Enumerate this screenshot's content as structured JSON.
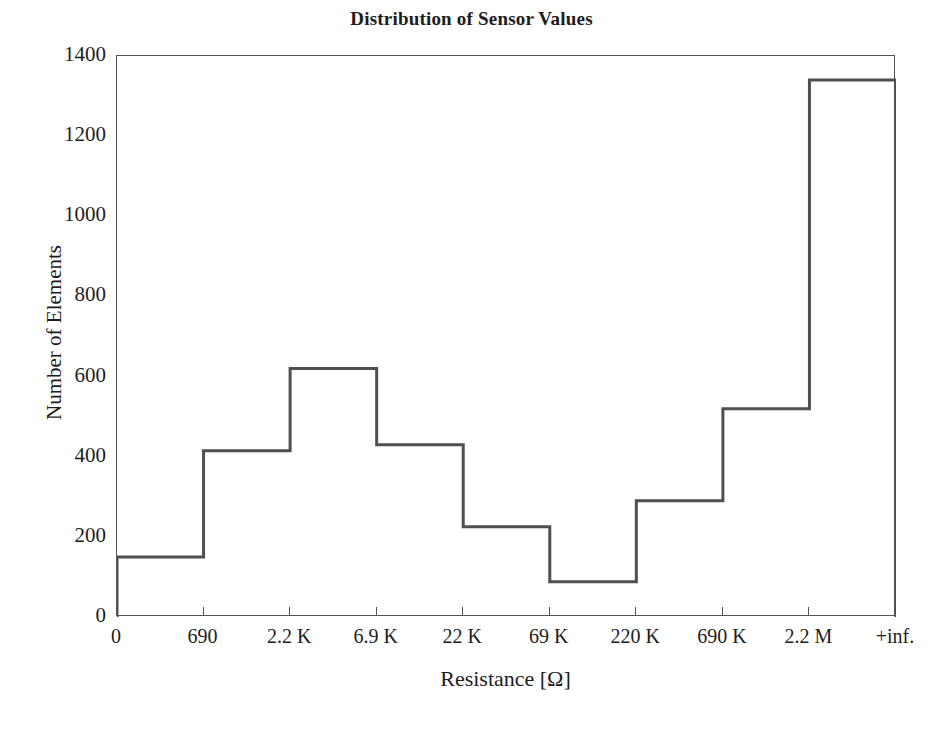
{
  "chart_data": {
    "type": "line",
    "plot_style": "step-post (histogram outline / stairs)",
    "title": "Distribution of Sensor Values",
    "xlabel": "Resistance [Ω]",
    "ylabel": "Number of Elements",
    "grid": false,
    "legend": null,
    "line_color": "#4f4f4f",
    "line_width_px": 3,
    "background_color": "#ffffff",
    "frame_color": "#555555",
    "x_tick_labels": [
      "0",
      "690",
      "2.2 K",
      "6.9 K",
      "22 K",
      "69 K",
      "220 K",
      "690 K",
      "2.2 M",
      "+inf."
    ],
    "x_bin_edges_index": [
      0,
      1,
      2,
      3,
      4,
      5,
      6,
      7,
      8,
      9
    ],
    "categories": [
      "0 – 690",
      "690 – 2.2 K",
      "2.2 K – 6.9 K",
      "6.9 K – 22 K",
      "22 K – 69 K",
      "69 K – 220 K",
      "220 K – 690 K",
      "690 K – 2.2 M",
      "2.2 M – +inf."
    ],
    "values": [
      150,
      415,
      620,
      430,
      225,
      88,
      290,
      520,
      1340
    ],
    "ylim": [
      0,
      1400
    ],
    "y_ticks": [
      0,
      200,
      400,
      600,
      800,
      1000,
      1200,
      1400
    ],
    "y_tick_labels": [
      "0",
      "200",
      "400",
      "600",
      "800",
      "1000",
      "1200",
      "1400"
    ],
    "xlim_index": [
      0,
      9
    ]
  }
}
